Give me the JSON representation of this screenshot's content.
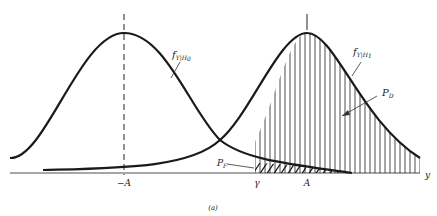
{
  "figure": {
    "caption": "(a)",
    "axis_label": "y",
    "ticks": [
      {
        "label": "−A",
        "x": 124
      },
      {
        "label": "γ",
        "x": 257
      },
      {
        "label": "A",
        "x": 307
      }
    ],
    "curves": [
      {
        "name": "f",
        "subscript": "Y|H",
        "subsub": "0",
        "label_full": "f_{Y|H_0}",
        "mean": "−A"
      },
      {
        "name": "f",
        "subscript": "Y|H",
        "subsub": "1",
        "label_full": "f_{Y|H_1}",
        "mean": "A"
      }
    ],
    "regions": [
      {
        "name": "P",
        "subscript": "D",
        "label_full": "P_D",
        "fill": "vertical-hatch",
        "description": "area under f_{Y|H_1} for y > γ"
      },
      {
        "name": "P",
        "subscript": "F",
        "label_full": "P_F",
        "fill": "diagonal-hatch",
        "description": "area under f_{Y|H_0} for y > γ"
      }
    ],
    "colors": {
      "stroke": "#1a1a1a",
      "axis": "#888888",
      "background": "#ffffff"
    }
  }
}
